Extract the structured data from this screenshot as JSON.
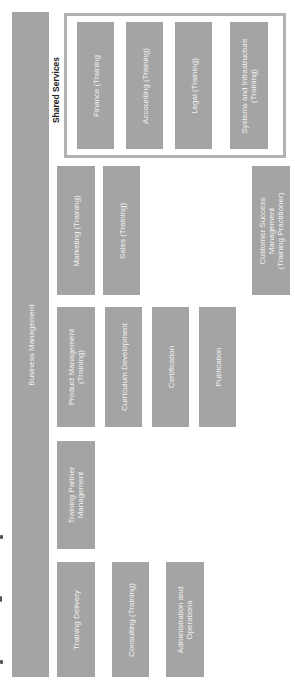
{
  "diagram": {
    "orientation": "rotated-90-ccw",
    "root": {
      "label": "Business Management"
    },
    "shared_services": {
      "label": "Shared Services",
      "items": [
        {
          "label": "Finance (Training"
        },
        {
          "label": "Accounting (Training)"
        },
        {
          "label": "Legal (Training)"
        },
        {
          "label": "Systems and Infrastructure\n(Training)"
        }
      ]
    },
    "units": {
      "marketing": "Marketing (Training)",
      "sales": "Sales (Training)",
      "customer_success": "Customer Success\nManagement\n(Training Practitioner)",
      "product_management": "Product Management\n(Training)",
      "curriculum_development": "Curriculum Development",
      "certification": "Certification",
      "publication": "Publication",
      "training_partner": "Training Partner\nManagement",
      "training_delivery": "Training Delivery",
      "consulting": "Consulting (Training)",
      "administration": "Administration and\nOperations"
    },
    "colors": {
      "box": "#a4a4a4",
      "box_text": "#f2f2f2",
      "group_border": "#b3b3b3"
    }
  }
}
